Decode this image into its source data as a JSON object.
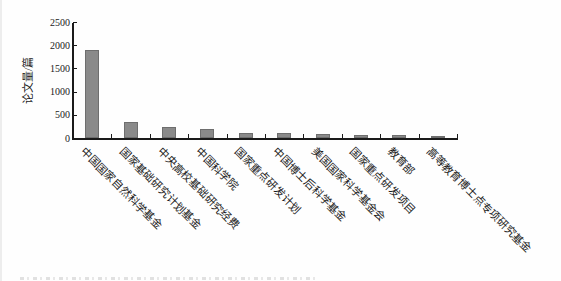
{
  "chart_data": {
    "type": "bar",
    "title": "",
    "xlabel": "",
    "ylabel": "论文量/篇",
    "categories": [
      "中国国家自然科学基金",
      "国家基础研究计划基金",
      "中央高校基础研究经费",
      "中国科学院",
      "国家重点研发计划",
      "中国博士后科学基金",
      "美国国家科学基金会",
      "国家重点研发项目",
      "教育部",
      "高等教育博士点专项研究基金"
    ],
    "values": [
      1900,
      360,
      255,
      205,
      115,
      110,
      105,
      85,
      65,
      60
    ],
    "ylim": [
      0,
      2500
    ],
    "yticks": [
      0,
      500,
      1000,
      1500,
      2000,
      2500
    ],
    "grid": false,
    "legend": "none",
    "bar_color": "#8a8a8a",
    "bar_border_color": "#6e6e6e",
    "axis_color": "#1a1a1a",
    "label_rotation_deg": 45
  }
}
